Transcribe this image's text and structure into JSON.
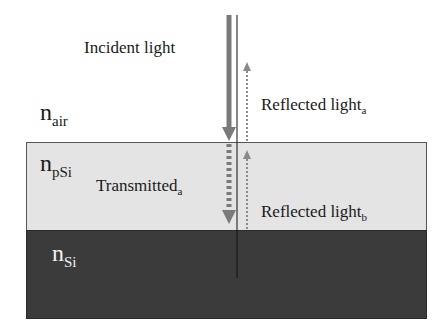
{
  "diagram": {
    "layers": [
      {
        "id": "air",
        "symbol": "n",
        "subscript": "air",
        "color": "#ffffff"
      },
      {
        "id": "psi",
        "symbol": "n",
        "subscript": "pSi",
        "color": "#e4e4e4"
      },
      {
        "id": "si",
        "symbol": "n",
        "subscript": "Si",
        "color": "#3b3b3b"
      }
    ],
    "labels": {
      "incident": "Incident light",
      "reflected_a": {
        "text": "Reflected light",
        "sub": "a"
      },
      "transmitted_a": {
        "text": "Transmitted",
        "sub": "a"
      },
      "reflected_b": {
        "text": "Reflected light",
        "sub": "b"
      }
    },
    "arrows": [
      {
        "name": "incident",
        "style": "solid-thick",
        "direction": "down",
        "color": "#7a7a7a"
      },
      {
        "name": "transmitted_a",
        "style": "dashed-thick",
        "direction": "down",
        "color": "#7a7a7a"
      },
      {
        "name": "reflected_a",
        "style": "dotted",
        "direction": "up",
        "color": "#8a8a8a"
      },
      {
        "name": "reflected_b",
        "style": "dotted",
        "direction": "up",
        "color": "#8a8a8a"
      }
    ],
    "normal_line_color": "#111111"
  }
}
